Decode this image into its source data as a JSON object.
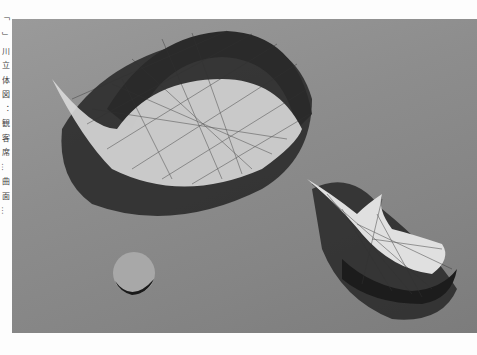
{
  "figure": {
    "caption_side_text": "「　」 川 立 体 図 ： 観 客 席 … 曲 面 …",
    "colors": {
      "background": "#8d8d8d",
      "shadow": "#1e1e1e",
      "surface_light": "#e6e6e6"
    }
  }
}
